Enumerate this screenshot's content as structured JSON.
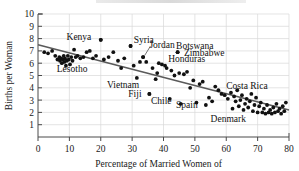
{
  "chart_data": {
    "type": "scatter",
    "title": "",
    "xlabel": "Percentage of Married Women of",
    "ylabel": "Births per Woman",
    "xlim": [
      0,
      80
    ],
    "ylim": [
      0,
      10
    ],
    "xticks": [
      0,
      10,
      20,
      30,
      40,
      50,
      60,
      70,
      80
    ],
    "yticks": [
      1,
      2,
      3,
      4,
      5,
      6,
      7,
      8,
      9,
      10
    ],
    "grid": true,
    "legend": "none",
    "trendline": {
      "type": "linear",
      "x": [
        0,
        80
      ],
      "y": [
        7.5,
        2.2
      ]
    },
    "annotations": [
      {
        "label": "Kenya",
        "x": 17.0,
        "y": 8.2,
        "anchor": "end",
        "point_x": 20.0,
        "point_y": 7.9
      },
      {
        "label": "Syria",
        "x": 30.5,
        "y": 7.9,
        "anchor": "start",
        "point_x": 29.5,
        "point_y": 7.4
      },
      {
        "label": "Jordan",
        "x": 35.5,
        "y": 7.5,
        "anchor": "start",
        "point_x": 33.5,
        "point_y": 6.5,
        "leader": true
      },
      {
        "label": "Botswana",
        "x": 44.0,
        "y": 7.4,
        "anchor": "start",
        "point_x": null,
        "point_y": null
      },
      {
        "label": "Zimbabwe",
        "x": 46.5,
        "y": 6.9,
        "anchor": "start",
        "point_x": 44.5,
        "point_y": 6.9
      },
      {
        "label": "Honduras",
        "x": 41.5,
        "y": 6.4,
        "anchor": "start",
        "point_x": null,
        "point_y": null
      },
      {
        "label": "Lesotho",
        "x": 6.0,
        "y": 5.6,
        "anchor": "start",
        "point_x": null,
        "point_y": null
      },
      {
        "label": "Vietnam",
        "x": 22.0,
        "y": 4.3,
        "anchor": "start",
        "point_x": null,
        "point_y": null
      },
      {
        "label": "Fiji",
        "x": 33.0,
        "y": 3.5,
        "anchor": "end",
        "point_x": 35.5,
        "point_y": 3.5
      },
      {
        "label": "Chile",
        "x": 36.0,
        "y": 3.0,
        "anchor": "start",
        "point_x": null,
        "point_y": null
      },
      {
        "label": "Spain",
        "x": 44.0,
        "y": 2.6,
        "anchor": "start",
        "point_x": null,
        "point_y": null
      },
      {
        "label": "Costa Rica",
        "x": 60.0,
        "y": 4.2,
        "anchor": "start",
        "point_x": null,
        "point_y": null
      },
      {
        "label": "Denmark",
        "x": 55.0,
        "y": 1.5,
        "anchor": "start",
        "point_x": null,
        "point_y": null
      }
    ],
    "points": [
      {
        "x": 2.0,
        "y": 6.9
      },
      {
        "x": 3.2,
        "y": 6.8
      },
      {
        "x": 4.5,
        "y": 7.0
      },
      {
        "x": 5.5,
        "y": 6.6
      },
      {
        "x": 6.2,
        "y": 6.3
      },
      {
        "x": 6.8,
        "y": 6.5
      },
      {
        "x": 7.0,
        "y": 6.2
      },
      {
        "x": 7.4,
        "y": 6.4
      },
      {
        "x": 7.6,
        "y": 6.0
      },
      {
        "x": 7.9,
        "y": 6.3
      },
      {
        "x": 8.2,
        "y": 6.6
      },
      {
        "x": 8.4,
        "y": 6.1
      },
      {
        "x": 8.6,
        "y": 6.4
      },
      {
        "x": 8.9,
        "y": 5.8
      },
      {
        "x": 9.2,
        "y": 6.2
      },
      {
        "x": 9.5,
        "y": 6.6
      },
      {
        "x": 9.8,
        "y": 6.3
      },
      {
        "x": 10.2,
        "y": 5.9
      },
      {
        "x": 10.6,
        "y": 6.5
      },
      {
        "x": 11.0,
        "y": 6.2
      },
      {
        "x": 11.5,
        "y": 7.1
      },
      {
        "x": 12.0,
        "y": 6.5
      },
      {
        "x": 12.6,
        "y": 6.6
      },
      {
        "x": 13.5,
        "y": 6.4
      },
      {
        "x": 14.5,
        "y": 6.5
      },
      {
        "x": 15.5,
        "y": 6.9
      },
      {
        "x": 16.5,
        "y": 7.0
      },
      {
        "x": 17.5,
        "y": 6.4
      },
      {
        "x": 18.5,
        "y": 6.6
      },
      {
        "x": 20.0,
        "y": 7.9
      },
      {
        "x": 21.0,
        "y": 6.3
      },
      {
        "x": 22.5,
        "y": 6.5
      },
      {
        "x": 24.0,
        "y": 6.9
      },
      {
        "x": 25.5,
        "y": 6.2
      },
      {
        "x": 26.5,
        "y": 5.6
      },
      {
        "x": 27.5,
        "y": 6.4
      },
      {
        "x": 29.5,
        "y": 7.4
      },
      {
        "x": 30.5,
        "y": 5.8
      },
      {
        "x": 31.5,
        "y": 4.8
      },
      {
        "x": 32.5,
        "y": 6.1
      },
      {
        "x": 33.5,
        "y": 6.5
      },
      {
        "x": 34.5,
        "y": 6.1
      },
      {
        "x": 35.5,
        "y": 3.5
      },
      {
        "x": 36.5,
        "y": 5.6
      },
      {
        "x": 37.5,
        "y": 4.7
      },
      {
        "x": 38.0,
        "y": 5.2
      },
      {
        "x": 38.5,
        "y": 6.0
      },
      {
        "x": 39.5,
        "y": 5.9
      },
      {
        "x": 40.5,
        "y": 5.8
      },
      {
        "x": 41.0,
        "y": 5.6
      },
      {
        "x": 42.0,
        "y": 3.1
      },
      {
        "x": 42.5,
        "y": 5.4
      },
      {
        "x": 43.5,
        "y": 5.0
      },
      {
        "x": 44.5,
        "y": 6.9
      },
      {
        "x": 45.0,
        "y": 5.2
      },
      {
        "x": 45.5,
        "y": 2.7
      },
      {
        "x": 46.5,
        "y": 5.1
      },
      {
        "x": 47.5,
        "y": 5.3
      },
      {
        "x": 48.5,
        "y": 4.0
      },
      {
        "x": 49.5,
        "y": 4.6
      },
      {
        "x": 50.5,
        "y": 2.8
      },
      {
        "x": 51.5,
        "y": 4.3
      },
      {
        "x": 52.5,
        "y": 4.5
      },
      {
        "x": 53.5,
        "y": 2.6
      },
      {
        "x": 54.5,
        "y": 3.2
      },
      {
        "x": 55.5,
        "y": 2.9
      },
      {
        "x": 56.5,
        "y": 4.1
      },
      {
        "x": 57.5,
        "y": 3.8
      },
      {
        "x": 58.5,
        "y": 3.5
      },
      {
        "x": 59.5,
        "y": 3.4
      },
      {
        "x": 60.5,
        "y": 3.1
      },
      {
        "x": 61.5,
        "y": 3.6
      },
      {
        "x": 62.0,
        "y": 2.3
      },
      {
        "x": 62.5,
        "y": 3.3
      },
      {
        "x": 63.0,
        "y": 2.9
      },
      {
        "x": 63.5,
        "y": 3.8
      },
      {
        "x": 64.0,
        "y": 2.5
      },
      {
        "x": 64.5,
        "y": 3.0
      },
      {
        "x": 65.0,
        "y": 3.4
      },
      {
        "x": 65.5,
        "y": 2.2
      },
      {
        "x": 66.0,
        "y": 2.7
      },
      {
        "x": 66.5,
        "y": 3.1
      },
      {
        "x": 67.0,
        "y": 2.4
      },
      {
        "x": 67.5,
        "y": 2.9
      },
      {
        "x": 68.0,
        "y": 3.5
      },
      {
        "x": 68.5,
        "y": 2.1
      },
      {
        "x": 69.0,
        "y": 2.6
      },
      {
        "x": 69.5,
        "y": 3.2
      },
      {
        "x": 70.0,
        "y": 2.0
      },
      {
        "x": 70.5,
        "y": 2.5
      },
      {
        "x": 71.0,
        "y": 2.8
      },
      {
        "x": 71.5,
        "y": 2.0
      },
      {
        "x": 72.0,
        "y": 2.3
      },
      {
        "x": 72.5,
        "y": 1.9
      },
      {
        "x": 73.0,
        "y": 2.6
      },
      {
        "x": 73.5,
        "y": 2.0
      },
      {
        "x": 74.0,
        "y": 2.2
      },
      {
        "x": 74.5,
        "y": 1.9
      },
      {
        "x": 75.0,
        "y": 2.4
      },
      {
        "x": 75.5,
        "y": 2.0
      },
      {
        "x": 76.0,
        "y": 2.7
      },
      {
        "x": 76.5,
        "y": 2.1
      },
      {
        "x": 77.0,
        "y": 2.3
      },
      {
        "x": 77.5,
        "y": 1.9
      },
      {
        "x": 78.0,
        "y": 2.5
      },
      {
        "x": 78.5,
        "y": 2.1
      },
      {
        "x": 79.0,
        "y": 2.8
      }
    ]
  }
}
